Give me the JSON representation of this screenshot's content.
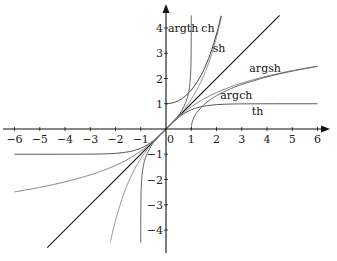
{
  "chart_data": {
    "type": "line",
    "title": "",
    "xlabel": "",
    "ylabel": "",
    "xlim": [
      -6,
      6
    ],
    "ylim": [
      -4.5,
      4.5
    ],
    "grid": false,
    "legend": "inline labels",
    "x_ticks": [
      -6,
      -5,
      -4,
      -3,
      -2,
      -1,
      0,
      1,
      2,
      3,
      4,
      5,
      6
    ],
    "x_tick_labels": [
      "−6",
      "−5",
      "−4",
      "−3",
      "−2",
      "−1",
      "0",
      "1",
      "2",
      "3",
      "4",
      "5",
      "6"
    ],
    "y_ticks": [
      -4,
      -3,
      -2,
      -1,
      1,
      2,
      3,
      4
    ],
    "y_tick_labels": [
      "−4",
      "−3",
      "−2",
      "−1",
      "1",
      "2",
      "3",
      "4"
    ],
    "origin_label": "0",
    "series": [
      {
        "name": "identity",
        "label": "",
        "color": "#111111",
        "width": 1.1,
        "points": [
          [
            -4.7,
            -4.7
          ],
          [
            4.5,
            4.5
          ]
        ]
      },
      {
        "name": "th",
        "label": "th",
        "color": "#555555",
        "width": 1,
        "points": [
          [
            -6,
            -1.0
          ],
          [
            -4,
            -0.999
          ],
          [
            -3,
            -0.995
          ],
          [
            -2.5,
            -0.987
          ],
          [
            -2,
            -0.964
          ],
          [
            -1.5,
            -0.905
          ],
          [
            -1.25,
            -0.848
          ],
          [
            -1,
            -0.762
          ],
          [
            -0.75,
            -0.635
          ],
          [
            -0.5,
            -0.462
          ],
          [
            -0.25,
            -0.245
          ],
          [
            0,
            0
          ],
          [
            0.25,
            0.245
          ],
          [
            0.5,
            0.462
          ],
          [
            0.75,
            0.635
          ],
          [
            1,
            0.762
          ],
          [
            1.25,
            0.848
          ],
          [
            1.5,
            0.905
          ],
          [
            2,
            0.964
          ],
          [
            2.5,
            0.987
          ],
          [
            3,
            0.995
          ],
          [
            4,
            0.999
          ],
          [
            6,
            1.0
          ]
        ]
      },
      {
        "name": "argsh",
        "label": "argsh",
        "color": "#888888",
        "width": 1,
        "points": [
          [
            -6,
            -2.492
          ],
          [
            -5,
            -2.312
          ],
          [
            -4,
            -2.095
          ],
          [
            -3,
            -1.818
          ],
          [
            -2.5,
            -1.647
          ],
          [
            -2,
            -1.444
          ],
          [
            -1.5,
            -1.195
          ],
          [
            -1,
            -0.881
          ],
          [
            -0.75,
            -0.693
          ],
          [
            -0.5,
            -0.481
          ],
          [
            -0.25,
            -0.247
          ],
          [
            0,
            0
          ],
          [
            0.25,
            0.247
          ],
          [
            0.5,
            0.481
          ],
          [
            0.75,
            0.693
          ],
          [
            1,
            0.881
          ],
          [
            1.5,
            1.195
          ],
          [
            2,
            1.444
          ],
          [
            2.5,
            1.647
          ],
          [
            3,
            1.818
          ],
          [
            4,
            2.095
          ],
          [
            5,
            2.312
          ],
          [
            6,
            2.492
          ]
        ]
      },
      {
        "name": "sh",
        "label": "sh",
        "color": "#999999",
        "width": 1,
        "points": [
          [
            -2.2,
            -4.457
          ],
          [
            -2,
            -3.627
          ],
          [
            -1.75,
            -2.79
          ],
          [
            -1.5,
            -2.129
          ],
          [
            -1.25,
            -1.602
          ],
          [
            -1,
            -1.175
          ],
          [
            -0.75,
            -0.822
          ],
          [
            -0.5,
            -0.521
          ],
          [
            -0.25,
            -0.253
          ],
          [
            0,
            0
          ],
          [
            0.25,
            0.253
          ],
          [
            0.5,
            0.521
          ],
          [
            0.75,
            0.822
          ],
          [
            1,
            1.175
          ],
          [
            1.25,
            1.602
          ],
          [
            1.5,
            2.129
          ],
          [
            1.75,
            2.79
          ],
          [
            2,
            3.627
          ],
          [
            2.2,
            4.457
          ]
        ]
      },
      {
        "name": "ch",
        "label": "ch",
        "color": "#444444",
        "width": 1,
        "points": [
          [
            0,
            1.0
          ],
          [
            0.25,
            1.031
          ],
          [
            0.5,
            1.128
          ],
          [
            0.75,
            1.295
          ],
          [
            1,
            1.543
          ],
          [
            1.25,
            1.888
          ],
          [
            1.5,
            2.352
          ],
          [
            1.75,
            2.964
          ],
          [
            2,
            3.762
          ],
          [
            2.18,
            4.484
          ]
        ]
      },
      {
        "name": "argch",
        "label": "argch",
        "color": "#666666",
        "width": 1,
        "points": [
          [
            1,
            0
          ],
          [
            1.02,
            0.199
          ],
          [
            1.05,
            0.315
          ],
          [
            1.1,
            0.444
          ],
          [
            1.2,
            0.622
          ],
          [
            1.35,
            0.8
          ],
          [
            1.5,
            0.962
          ],
          [
            1.75,
            1.159
          ],
          [
            2,
            1.317
          ],
          [
            2.5,
            1.567
          ],
          [
            3,
            1.763
          ],
          [
            4,
            2.063
          ],
          [
            5,
            2.292
          ],
          [
            6,
            2.478
          ]
        ]
      },
      {
        "name": "argth",
        "label": "argth",
        "color": "#666666",
        "width": 1,
        "points": [
          [
            -0.99975,
            -4.5
          ],
          [
            -0.9995,
            -4.15
          ],
          [
            -0.999,
            -3.8
          ],
          [
            -0.998,
            -3.45
          ],
          [
            -0.995,
            -2.99
          ],
          [
            -0.99,
            -2.647
          ],
          [
            -0.98,
            -2.298
          ],
          [
            -0.95,
            -1.832
          ],
          [
            -0.9,
            -1.472
          ],
          [
            -0.8,
            -1.099
          ],
          [
            -0.6,
            -0.693
          ],
          [
            -0.4,
            -0.424
          ],
          [
            -0.2,
            -0.203
          ],
          [
            0,
            0
          ],
          [
            0.2,
            0.203
          ],
          [
            0.4,
            0.424
          ],
          [
            0.6,
            0.693
          ],
          [
            0.8,
            1.099
          ],
          [
            0.9,
            1.472
          ],
          [
            0.95,
            1.832
          ],
          [
            0.98,
            2.298
          ],
          [
            0.99,
            2.647
          ],
          [
            0.995,
            2.99
          ],
          [
            0.998,
            3.45
          ],
          [
            0.999,
            3.8
          ],
          [
            0.9995,
            4.15
          ],
          [
            0.99975,
            4.5
          ]
        ]
      }
    ],
    "annotations": [
      {
        "text": "argth",
        "x": 0.08,
        "y": 3.85
      },
      {
        "text": "ch",
        "x": 1.4,
        "y": 3.85
      },
      {
        "text": "sh",
        "x": 1.85,
        "y": 3.05
      },
      {
        "text": "argsh",
        "x": 3.3,
        "y": 2.25
      },
      {
        "text": "argch",
        "x": 2.15,
        "y": 1.2
      },
      {
        "text": "th",
        "x": 3.4,
        "y": 0.55
      }
    ]
  },
  "layout": {
    "origin_px": [
      166,
      129
    ],
    "scale_px": 25.25,
    "x_axis_px": [
      3,
      330
    ],
    "y_axis_px": [
      4,
      253
    ]
  }
}
